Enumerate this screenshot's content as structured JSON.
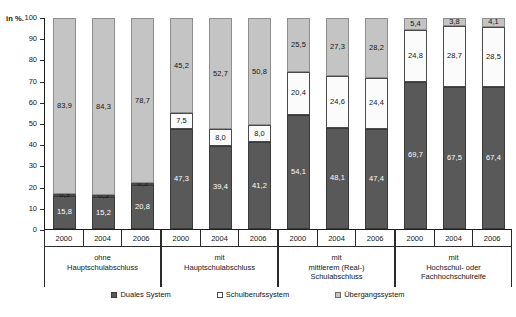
{
  "chart_data": {
    "type": "bar",
    "stacked": true,
    "title": "",
    "subtitle": "",
    "xlabel": "",
    "ylabel": "in %.",
    "ylim": [
      0,
      100
    ],
    "yticks": [
      0,
      10,
      20,
      30,
      40,
      50,
      60,
      70,
      80,
      90,
      100
    ],
    "grid": false,
    "legend_position": "bottom",
    "x": [
      "2000",
      "2004",
      "2006",
      "2000",
      "2004",
      "2006",
      "2000",
      "2004",
      "2006",
      "2000",
      "2004",
      "2006"
    ],
    "groups": [
      {
        "label_lines": [
          "ohne",
          "Hauptschulabschluss"
        ],
        "years": [
          "2000",
          "2004",
          "2006"
        ]
      },
      {
        "label_lines": [
          "mit",
          "Hauptschulabschluss"
        ],
        "years": [
          "2000",
          "2004",
          "2006"
        ]
      },
      {
        "label_lines": [
          "mit",
          "mittlerem (Real-)",
          "Schulabschluss"
        ],
        "years": [
          "2000",
          "2004",
          "2006"
        ]
      },
      {
        "label_lines": [
          "mit",
          "Hochschul- oder",
          "Fachhochschulreife"
        ],
        "years": [
          "2000",
          "2004",
          "2006"
        ]
      }
    ],
    "series": [
      {
        "name": "Duales System",
        "color": "#595959",
        "values": [
          15.8,
          15.2,
          20.8,
          47.3,
          39.4,
          41.2,
          54.1,
          48.1,
          47.4,
          69.7,
          67.5,
          67.4
        ],
        "labels": [
          "15,8",
          "15,2",
          "20,8",
          "47,3",
          "39,4",
          "41,2",
          "54,1",
          "48,1",
          "47,4",
          "69,7",
          "67,5",
          "67,4"
        ]
      },
      {
        "name": "Schulberufssystem",
        "color": "#fbfbfb",
        "values": [
          0.3,
          0.5,
          0.5,
          7.5,
          8.0,
          8.0,
          20.4,
          24.6,
          24.4,
          24.8,
          28.7,
          28.5
        ],
        "labels": [
          "0,3",
          "0,5",
          "0,5",
          "7,5",
          "8,0",
          "8,0",
          "20,4",
          "24,6",
          "24,4",
          "24,8",
          "28,7",
          "28,5"
        ]
      },
      {
        "name": "Übergangssystem",
        "color": "#c4c4c4",
        "values": [
          83.9,
          84.3,
          78.7,
          45.2,
          52.7,
          50.8,
          25.5,
          27.3,
          28.2,
          5.4,
          3.8,
          4.1
        ],
        "labels": [
          "83,9",
          "84,3",
          "78,7",
          "45,2",
          "52,7",
          "50,8",
          "25,5",
          "27,3",
          "28,2",
          "5,4",
          "3,8",
          "4,1"
        ]
      }
    ]
  }
}
